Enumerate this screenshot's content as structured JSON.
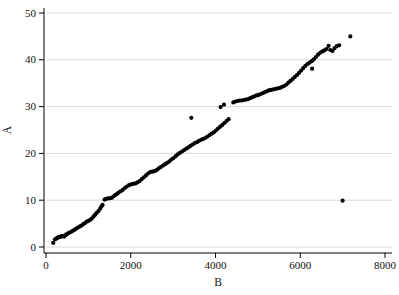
{
  "figure": {
    "background": "#ffffff",
    "width_px": 399,
    "height_px": 295
  },
  "chart_data": {
    "type": "scatter",
    "title": "",
    "xlabel": "B",
    "ylabel": "A",
    "xlim": [
      0,
      8000
    ],
    "ylim": [
      0,
      50
    ],
    "x_ticks": [
      0,
      2000,
      4000,
      6000,
      8000
    ],
    "y_ticks": [
      0,
      10,
      20,
      30,
      40,
      50
    ],
    "grid": "horizontal-only",
    "legend": "none",
    "marker": {
      "shape": "circle",
      "color": "#000000",
      "radius_px": 2.1
    },
    "gridline_color": "#d9d9d9",
    "axis_color": "#000000",
    "points": [
      [
        170,
        0.9
      ],
      [
        210,
        1.6
      ],
      [
        240,
        1.8
      ],
      [
        265,
        1.9
      ],
      [
        290,
        2.1
      ],
      [
        315,
        2.1
      ],
      [
        340,
        2.2
      ],
      [
        370,
        2.3
      ],
      [
        400,
        2.3
      ],
      [
        425,
        2.2
      ],
      [
        455,
        2.5
      ],
      [
        480,
        2.7
      ],
      [
        520,
        2.9
      ],
      [
        560,
        3.1
      ],
      [
        600,
        3.3
      ],
      [
        640,
        3.5
      ],
      [
        680,
        3.7
      ],
      [
        720,
        4.0
      ],
      [
        760,
        4.2
      ],
      [
        800,
        4.4
      ],
      [
        840,
        4.6
      ],
      [
        880,
        4.9
      ],
      [
        920,
        5.1
      ],
      [
        960,
        5.4
      ],
      [
        1000,
        5.6
      ],
      [
        1040,
        5.8
      ],
      [
        1080,
        6.1
      ],
      [
        1120,
        6.5
      ],
      [
        1160,
        6.9
      ],
      [
        1200,
        7.3
      ],
      [
        1240,
        7.7
      ],
      [
        1280,
        8.2
      ],
      [
        1310,
        8.7
      ],
      [
        1335,
        9.0
      ],
      [
        1380,
        10.1
      ],
      [
        1420,
        10.3
      ],
      [
        1460,
        10.4
      ],
      [
        1500,
        10.4
      ],
      [
        1545,
        10.5
      ],
      [
        1590,
        10.8
      ],
      [
        1630,
        11.1
      ],
      [
        1670,
        11.3
      ],
      [
        1710,
        11.6
      ],
      [
        1760,
        11.9
      ],
      [
        1810,
        12.2
      ],
      [
        1860,
        12.6
      ],
      [
        1910,
        12.9
      ],
      [
        1960,
        13.2
      ],
      [
        2010,
        13.4
      ],
      [
        2060,
        13.5
      ],
      [
        2110,
        13.6
      ],
      [
        2160,
        13.8
      ],
      [
        2210,
        14.1
      ],
      [
        2260,
        14.5
      ],
      [
        2310,
        14.9
      ],
      [
        2360,
        15.3
      ],
      [
        2410,
        15.7
      ],
      [
        2460,
        16.0
      ],
      [
        2510,
        16.1
      ],
      [
        2560,
        16.2
      ],
      [
        2610,
        16.4
      ],
      [
        2660,
        16.8
      ],
      [
        2710,
        17.1
      ],
      [
        2760,
        17.4
      ],
      [
        2810,
        17.7
      ],
      [
        2860,
        18.0
      ],
      [
        2910,
        18.3
      ],
      [
        2960,
        18.7
      ],
      [
        3010,
        19.0
      ],
      [
        3060,
        19.4
      ],
      [
        3110,
        19.8
      ],
      [
        3160,
        20.1
      ],
      [
        3210,
        20.4
      ],
      [
        3260,
        20.7
      ],
      [
        3310,
        21.0
      ],
      [
        3360,
        21.3
      ],
      [
        3410,
        21.6
      ],
      [
        3430,
        27.6
      ],
      [
        3460,
        21.9
      ],
      [
        3510,
        22.2
      ],
      [
        3560,
        22.4
      ],
      [
        3610,
        22.7
      ],
      [
        3660,
        22.9
      ],
      [
        3710,
        23.1
      ],
      [
        3760,
        23.3
      ],
      [
        3810,
        23.6
      ],
      [
        3860,
        23.9
      ],
      [
        3910,
        24.2
      ],
      [
        3960,
        24.5
      ],
      [
        4010,
        24.9
      ],
      [
        4060,
        25.3
      ],
      [
        4110,
        25.7
      ],
      [
        4120,
        29.9
      ],
      [
        4160,
        26.1
      ],
      [
        4200,
        30.4
      ],
      [
        4210,
        26.5
      ],
      [
        4260,
        26.9
      ],
      [
        4310,
        27.3
      ],
      [
        4420,
        30.9
      ],
      [
        4470,
        31.1
      ],
      [
        4520,
        31.2
      ],
      [
        4570,
        31.3
      ],
      [
        4620,
        31.3
      ],
      [
        4670,
        31.4
      ],
      [
        4720,
        31.5
      ],
      [
        4770,
        31.6
      ],
      [
        4820,
        31.8
      ],
      [
        4870,
        32.0
      ],
      [
        4920,
        32.2
      ],
      [
        4970,
        32.4
      ],
      [
        5020,
        32.5
      ],
      [
        5070,
        32.7
      ],
      [
        5120,
        32.9
      ],
      [
        5170,
        33.1
      ],
      [
        5220,
        33.3
      ],
      [
        5270,
        33.5
      ],
      [
        5320,
        33.6
      ],
      [
        5370,
        33.7
      ],
      [
        5420,
        33.8
      ],
      [
        5470,
        33.9
      ],
      [
        5520,
        34.0
      ],
      [
        5570,
        34.2
      ],
      [
        5620,
        34.4
      ],
      [
        5670,
        34.7
      ],
      [
        5720,
        35.1
      ],
      [
        5770,
        35.5
      ],
      [
        5820,
        35.9
      ],
      [
        5870,
        36.3
      ],
      [
        5920,
        36.7
      ],
      [
        5970,
        37.2
      ],
      [
        6020,
        37.7
      ],
      [
        6070,
        38.2
      ],
      [
        6120,
        38.7
      ],
      [
        6170,
        39.1
      ],
      [
        6220,
        39.4
      ],
      [
        6270,
        39.7
      ],
      [
        6280,
        38.1
      ],
      [
        6320,
        40.1
      ],
      [
        6370,
        40.6
      ],
      [
        6420,
        41.1
      ],
      [
        6470,
        41.5
      ],
      [
        6520,
        41.8
      ],
      [
        6570,
        42.0
      ],
      [
        6620,
        42.3
      ],
      [
        6670,
        43.0
      ],
      [
        6710,
        42.1
      ],
      [
        6760,
        41.9
      ],
      [
        6810,
        42.5
      ],
      [
        6860,
        42.9
      ],
      [
        6920,
        43.1
      ],
      [
        7000,
        9.9
      ],
      [
        7180,
        45.0
      ]
    ]
  }
}
